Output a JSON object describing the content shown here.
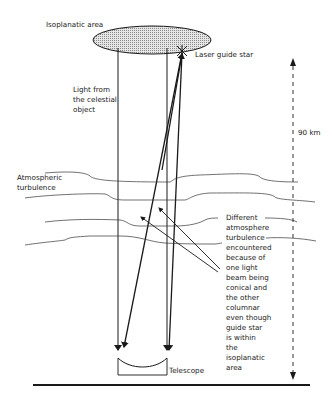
{
  "diagram": {
    "type": "adaptive-optics-laser-guide-star",
    "labels": {
      "isoplanatic_area": "Isoplanatic area",
      "laser_guide_star": "Laser guide star",
      "light_from_object": [
        "Light from",
        "the celestial",
        "object"
      ],
      "atmospheric_turbulence": [
        "Atmospheric",
        "turbulence"
      ],
      "height": "90 km",
      "telescope": "Telescope",
      "explanation": [
        "Different",
        "atmosphere",
        "turbulence",
        "encountered",
        "because of",
        "one light",
        "beam being",
        "conical and",
        "the other",
        "columnar",
        "even though",
        "guide star",
        "is within",
        "the",
        "isoplanatic",
        "area"
      ]
    },
    "colors": {
      "line": "#1a1a1a",
      "ellipse_fill": "#c8c8c8",
      "background": "#ffffff"
    }
  }
}
